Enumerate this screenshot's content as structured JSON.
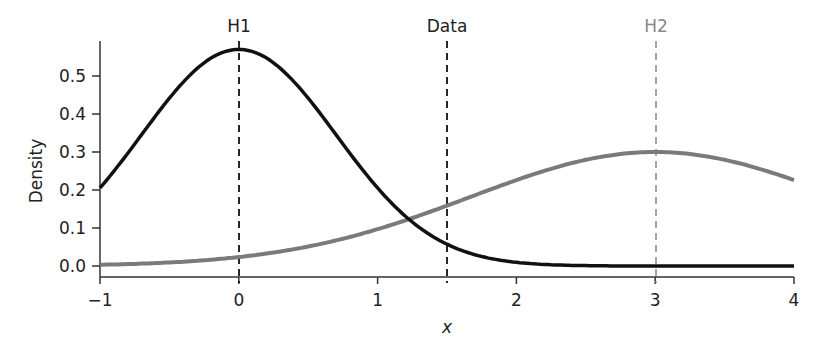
{
  "chart_data": {
    "type": "line",
    "title": "",
    "xlabel": "x",
    "ylabel": "Density",
    "xlim": [
      -1,
      4
    ],
    "ylim": [
      -0.02,
      0.59
    ],
    "x_ticks": [
      -1,
      0,
      1,
      2,
      3,
      4
    ],
    "x_tick_labels": [
      "−1",
      "0",
      "1",
      "2",
      "3",
      "4"
    ],
    "y_ticks": [
      0.0,
      0.1,
      0.2,
      0.3,
      0.4,
      0.5
    ],
    "y_tick_labels": [
      "0.0",
      "0.1",
      "0.2",
      "0.3",
      "0.4",
      "0.5"
    ],
    "grid": false,
    "series": [
      {
        "name": "H1",
        "distribution": "normal",
        "mean": 0,
        "sd": 0.7,
        "color": "#111111",
        "x": [
          -1,
          -0.5,
          0,
          0.5,
          1,
          1.5,
          2,
          2.5,
          3,
          3.5,
          4
        ],
        "values": [
          0.205,
          0.44,
          0.57,
          0.44,
          0.205,
          0.057,
          0.01,
          0.001,
          0.0,
          0.0,
          0.0
        ]
      },
      {
        "name": "H2",
        "distribution": "normal",
        "mean": 3,
        "sd": 1.33,
        "color": "#7a7a7a",
        "x": [
          -1,
          -0.5,
          0,
          0.5,
          1,
          1.5,
          2,
          2.5,
          3,
          3.5,
          4
        ],
        "values": [
          0.003,
          0.007,
          0.024,
          0.05,
          0.096,
          0.16,
          0.226,
          0.28,
          0.3,
          0.28,
          0.226
        ]
      }
    ],
    "vlines": [
      {
        "label": "H1",
        "x": 0,
        "color": "#111111",
        "style": "dashed"
      },
      {
        "label": "Data",
        "x": 1.5,
        "color": "#111111",
        "style": "dashed"
      },
      {
        "label": "H2",
        "x": 3,
        "color": "#7a7a7a",
        "style": "dashed"
      }
    ],
    "legend": null
  },
  "labels": {
    "h1": "H1",
    "data": "Data",
    "h2": "H2",
    "xlabel": "x",
    "ylabel": "Density",
    "xticks": [
      "−1",
      "0",
      "1",
      "2",
      "3",
      "4"
    ],
    "yticks": [
      "0.0",
      "0.1",
      "0.2",
      "0.3",
      "0.4",
      "0.5"
    ]
  }
}
